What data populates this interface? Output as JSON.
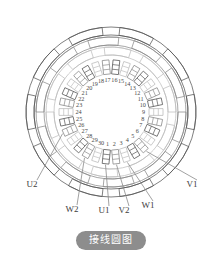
{
  "diagram": {
    "type": "motor-stator-winding-circle-diagram",
    "caption": "接线圆图",
    "slot_count": 30,
    "slot_numbers": [
      1,
      2,
      3,
      4,
      5,
      6,
      7,
      8,
      9,
      10,
      11,
      12,
      13,
      14,
      15,
      16,
      17,
      18,
      19,
      20,
      21,
      22,
      23,
      24,
      25,
      26,
      27,
      28,
      29,
      30
    ],
    "terminals": [
      {
        "id": "U1",
        "label": "U1",
        "x": 104,
        "y": 213,
        "lead_from_slot": 1
      },
      {
        "id": "V2",
        "label": "V2",
        "x": 124,
        "y": 213,
        "lead_from_slot": 2
      },
      {
        "id": "W1",
        "label": "W1",
        "x": 148,
        "y": 208,
        "lead_from_slot": 3
      },
      {
        "id": "V1",
        "label": "V1",
        "x": 192,
        "y": 187,
        "lead_from_slot": 5
      },
      {
        "id": "U2",
        "label": "U2",
        "x": 32,
        "y": 187,
        "lead_from_slot": 26
      },
      {
        "id": "W2",
        "label": "W2",
        "x": 72,
        "y": 212,
        "lead_from_slot": 29
      }
    ],
    "colors": {
      "line_dark": "#565656",
      "line_mid": "#8a8a8a",
      "line_light": "#bdbdbd",
      "caption_bg": "#8d8d8d",
      "caption_text": "#ffffff",
      "background": "#ffffff"
    },
    "geometry": {
      "center_x": 111,
      "center_y": 112,
      "bore_radius": 34,
      "slot_inner_radius": 38,
      "slot_outer_radius": 52,
      "arc_radii": [
        62,
        72,
        82
      ],
      "slot_angle_step": 12
    }
  }
}
